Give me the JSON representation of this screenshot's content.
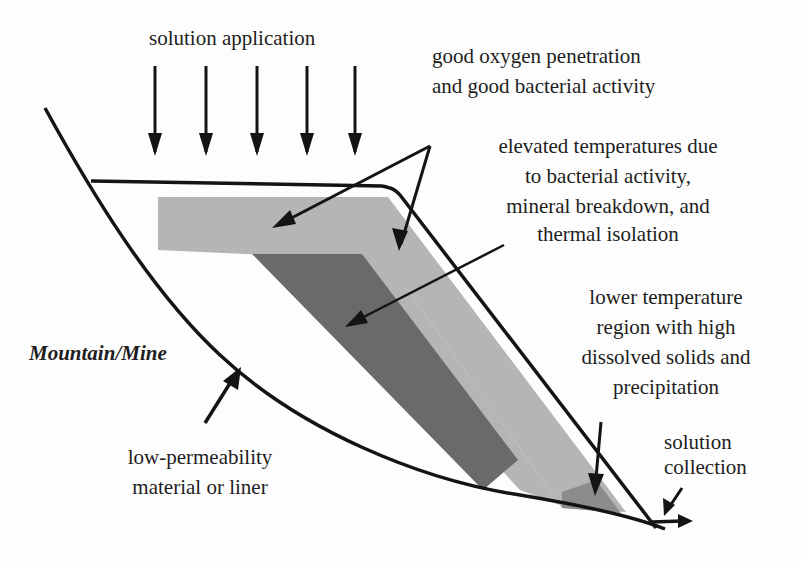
{
  "diagram": {
    "type": "heap-leach cross-section schematic",
    "colors": {
      "background": "#fdfdfd",
      "outline": "#141414",
      "light_zone": "#b5b5b5",
      "dark_zone": "#6a6a6a",
      "precipitation_zone": "#8c8c8c",
      "text": "#1e1e1e"
    },
    "labels": {
      "solution_application": "solution application",
      "oxygen_line1": "good oxygen penetration",
      "oxygen_line2": "and good bacterial activity",
      "elevated_line1": "elevated temperatures due",
      "elevated_line2": "to bacterial activity,",
      "elevated_line3": "mineral breakdown, and",
      "elevated_line4": "thermal isolation",
      "lower_line1": "lower temperature",
      "lower_line2": "region with high",
      "lower_line3": "dissolved solids and",
      "lower_line4": "precipitation",
      "mountain": "Mountain/Mine",
      "liner_line1": "low-permeability",
      "liner_line2": "material or liner",
      "collection_line1": "solution",
      "collection_line2": "collection"
    },
    "application_arrow_count": 5,
    "zones": [
      "good oxygen penetration zone (light gray)",
      "elevated temperature zone (dark gray)",
      "lower temperature precipitation zone (medium gray)"
    ]
  }
}
